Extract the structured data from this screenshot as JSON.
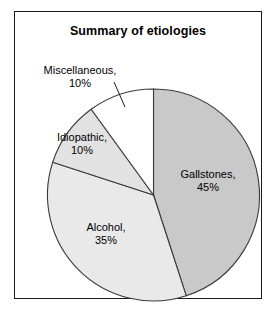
{
  "chart_data": {
    "type": "pie",
    "title": "Summary of etiologies",
    "categories": [
      "Gallstones",
      "Alcohol",
      "Idiopathic",
      "Miscellaneous"
    ],
    "values": [
      45,
      35,
      10,
      10
    ],
    "unit": "%",
    "slices": [
      {
        "label": "Gallstones",
        "value": 45,
        "value_text": "45%",
        "label_text": "Gallstones,",
        "color": "#c9c9c9",
        "start_deg": 0,
        "end_deg": 162,
        "label_placement": "inside"
      },
      {
        "label": "Alcohol",
        "value": 35,
        "value_text": "35%",
        "label_text": "Alcohol,",
        "color": "#e9e9e9",
        "start_deg": 162,
        "end_deg": 288,
        "label_placement": "inside"
      },
      {
        "label": "Idiopathic",
        "value": 10,
        "value_text": "10%",
        "label_text": "Idiopathic,",
        "color": "#e2e2e2",
        "start_deg": 288,
        "end_deg": 324,
        "label_placement": "inside"
      },
      {
        "label": "Miscellaneous",
        "value": 10,
        "value_text": "10%",
        "label_text": "Miscellaneous,",
        "color": "#ffffff",
        "start_deg": 324,
        "end_deg": 360,
        "label_placement": "outside-leader"
      }
    ],
    "legend": "none",
    "start_angle_deg": 0,
    "direction": "clockwise",
    "border_color": "#1a1a1a",
    "background_color": "#ffffff",
    "outline_color": "#3a3a3a"
  }
}
